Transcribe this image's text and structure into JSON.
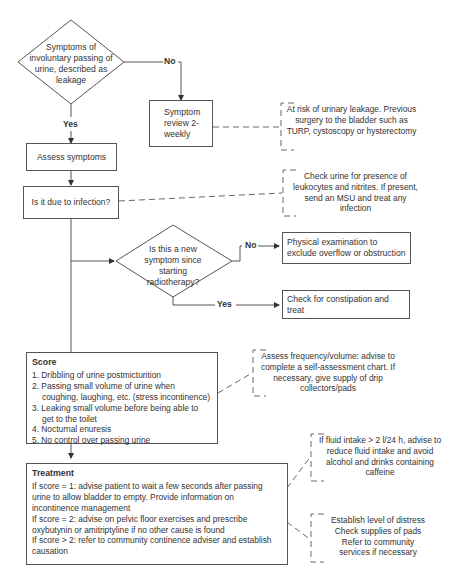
{
  "diagram": {
    "decisions": {
      "leakage": "Symptoms of involuntary passing of urine, described as leakage",
      "new_symptom": "Is this a new symptom since starting radiotherapy?"
    },
    "labels": {
      "no_1": "No",
      "yes_1": "Yes",
      "no_2": "No",
      "yes_2": "Yes"
    },
    "boxes": {
      "symptom_review": "Symptom review 2-weekly",
      "assess_symptoms": "Assess symptoms",
      "infection": "Is it due to infection?",
      "physical_exam": "Physical examination to exclude overflow or obstruction",
      "constipation": "Check for constipation and treat"
    },
    "notes": {
      "risk": "At risk of urinary leakage. Previous surgery to the bladder such as TURP, cystoscopy or hysterectomy",
      "urine_check": "Check urine for presence of leukocytes and nitrites. If present, send an MSU and treat any infection",
      "frequency": "Assess frequency/volume: advise to complete a self-assessment chart. If necessary, give supply of drip collectors/pads",
      "fluid": "If fluid intake > 2 l/24 h, advise to reduce fluid intake and avoid alcohol and drinks containing caffeine",
      "distress": [
        "Establish level of distress",
        "Check supplies of pads",
        "Refer to community",
        "services if necessary"
      ]
    },
    "score": {
      "title": "Score",
      "items": [
        "1. Dribbling of urine postmicturition",
        "2. Passing small volume of urine when coughing, laughing, etc. (stress incontinence)",
        "3. Leaking small volume before being able to get to the toilet",
        "4. Nocturnal enuresis",
        "5. No control over passing urine"
      ]
    },
    "treatment": {
      "title": "Treatment",
      "items": [
        "If score = 1: advise patient to wait a few seconds after passing urine to allow bladder to empty. Provide information on incontinence management",
        "If score = 2: advise on pelvic floor exercises and prescribe oxybutynin or amitriptyline if no other cause is found",
        "If score > 2: refer to community continence adviser and establish causation"
      ]
    },
    "colors": {
      "line": "#555555",
      "dashed": "#666666",
      "text": "#333333"
    }
  }
}
